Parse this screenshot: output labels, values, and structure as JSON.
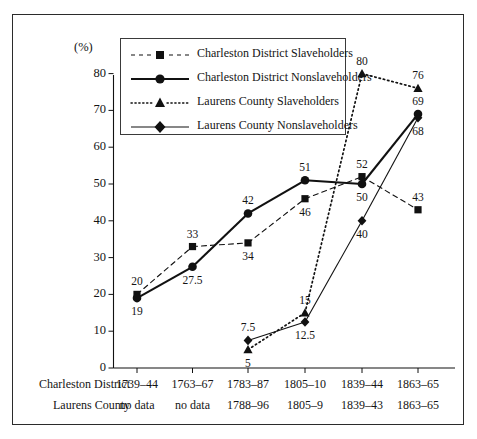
{
  "chart_data": {
    "type": "line",
    "title": "",
    "xlabel": "",
    "ylabel": "(%)",
    "ylim": [
      0,
      85
    ],
    "yticks": [
      0,
      10,
      20,
      30,
      40,
      50,
      60,
      70,
      80
    ],
    "grid": false,
    "legend_position": "top-left",
    "categories": [
      "1",
      "2",
      "3",
      "4",
      "5",
      "6"
    ],
    "x_axis_table": {
      "rows": [
        {
          "label": "Charleston District",
          "values": [
            "1739–44",
            "1763–67",
            "1783–87",
            "1805–10",
            "1839–44",
            "1863–65"
          ]
        },
        {
          "label": "Laurens County",
          "values": [
            "no data",
            "no data",
            "1788–96",
            "1805–9",
            "1839–43",
            "1863–65"
          ]
        }
      ]
    },
    "series": [
      {
        "name": "Charleston District Slaveholders",
        "marker": "square",
        "line": "dashed",
        "values": [
          20,
          33,
          34,
          46,
          52,
          43
        ],
        "label_pos": [
          "above",
          "above",
          "below",
          "below",
          "above",
          "above"
        ]
      },
      {
        "name": "Charleston District Nonslaveholders",
        "marker": "circle",
        "line": "solid-thick",
        "values": [
          19,
          27.5,
          42,
          51,
          50,
          69
        ],
        "label_pos": [
          "below",
          "below",
          "above",
          "above",
          "below",
          "above"
        ]
      },
      {
        "name": "Laurens County Slaveholders",
        "marker": "triangle",
        "line": "dotted",
        "values": [
          null,
          null,
          5,
          15,
          80,
          76
        ],
        "label_pos": [
          null,
          null,
          "below",
          "above",
          "above",
          "above"
        ]
      },
      {
        "name": "Laurens County Nonslaveholders",
        "marker": "diamond",
        "line": "solid-thin",
        "values": [
          null,
          null,
          7.5,
          12.5,
          40,
          68
        ],
        "label_pos": [
          null,
          null,
          "above",
          "below",
          "below",
          "below"
        ]
      }
    ],
    "colors": {
      "ink": "#111111",
      "frame": "#2b2b2b",
      "background": "#ffffff"
    }
  }
}
